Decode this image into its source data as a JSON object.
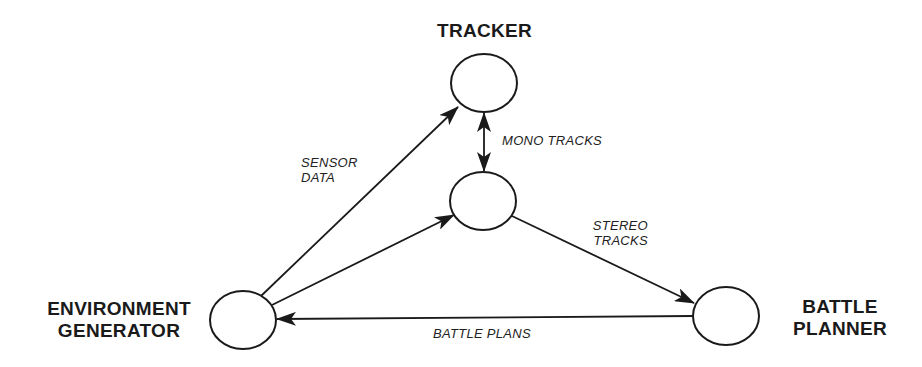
{
  "nodes": {
    "tracker": {
      "label": "TRACKER"
    },
    "middle": {
      "label": ""
    },
    "environment_generator": {
      "label_line1": "ENVIRONMENT",
      "label_line2": "GENERATOR"
    },
    "battle_planner": {
      "label_line1": "BATTLE",
      "label_line2": "PLANNER"
    }
  },
  "edges": [
    {
      "from": "environment_generator",
      "to": "tracker",
      "label_line1": "SENSOR",
      "label_line2": "DATA"
    },
    {
      "from": "environment_generator",
      "to": "middle",
      "label": ""
    },
    {
      "from": "tracker",
      "to": "middle",
      "bidirectional": true,
      "label": "MONO TRACKS"
    },
    {
      "from": "middle",
      "to": "battle_planner",
      "label_line1": "STEREO",
      "label_line2": "TRACKS"
    },
    {
      "from": "battle_planner",
      "to": "environment_generator",
      "label": "BATTLE PLANS"
    }
  ],
  "colors": {
    "stroke": "#1a1a1a",
    "background": "#ffffff"
  }
}
